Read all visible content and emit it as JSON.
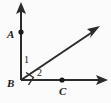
{
  "figure": {
    "type": "geometry-diagram",
    "background_color": "#fbfbfb",
    "stroke_color": "#2b2b2b",
    "point_labels": {
      "a": "A",
      "b": "B",
      "c": "C"
    },
    "angle_labels": {
      "one": "1",
      "two": "2"
    },
    "markers": {
      "right_angle": "right-angle-square"
    },
    "geometry": {
      "vertex": {
        "x": 21,
        "y": 80
      },
      "ray_vertical_tip": {
        "x": 21,
        "y": 3
      },
      "ray_horizontal_tip": {
        "x": 108,
        "y": 80
      },
      "ray_diagonal_tip": {
        "x": 100,
        "y": 26
      },
      "point_a_dot": {
        "x": 21,
        "y": 32
      },
      "point_c_dot": {
        "x": 62,
        "y": 80
      }
    }
  }
}
